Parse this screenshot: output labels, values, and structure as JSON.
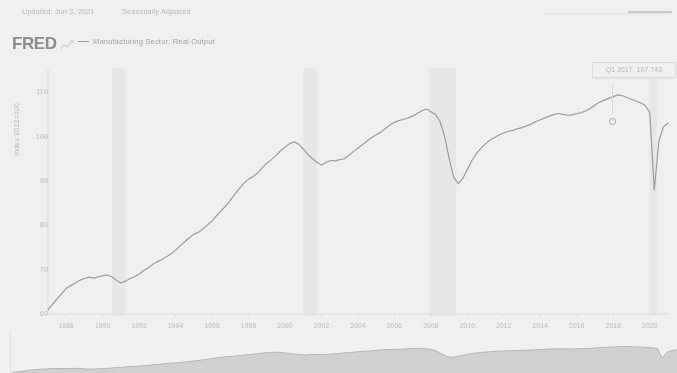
{
  "meta": {
    "updated": "Updated: Jun 3, 2021",
    "adjustment": "Seasonally Adjusted"
  },
  "header": {
    "logo": "FRED",
    "logo_mark": "mini-line-chart-icon",
    "legend_label": "Manufacturing Sector: Real Output"
  },
  "tooltip": {
    "text": "Q1 2017: 107.743"
  },
  "chart_data": {
    "type": "line",
    "title": "Manufacturing Sector: Real Output",
    "xlabel": "",
    "ylabel": "Index 2012=100",
    "ylim": [
      60,
      115
    ],
    "xlim": [
      1987.0,
      2021.0
    ],
    "grid": false,
    "legend_position": "top-left",
    "y_ticks": [
      "110",
      "100",
      "90",
      "80",
      "70",
      "60"
    ],
    "y_tick_values": [
      110,
      100,
      90,
      80,
      70,
      60
    ],
    "x_ticks": [
      "1988",
      "1990",
      "1992",
      "1994",
      "1996",
      "1998",
      "2000",
      "2002",
      "2004",
      "2006",
      "2008",
      "2010",
      "2012",
      "2014",
      "2016",
      "2018",
      "2020"
    ],
    "x_tick_values": [
      1988,
      1990,
      1992,
      1994,
      1996,
      1998,
      2000,
      2002,
      2004,
      2006,
      2008,
      2010,
      2012,
      2014,
      2016,
      2018,
      2020
    ],
    "series": [
      {
        "name": "Manufacturing Sector: Real Output",
        "color": "#8f9398",
        "x": [
          1987.0,
          1987.25,
          1987.5,
          1987.75,
          1988.0,
          1988.25,
          1988.5,
          1988.75,
          1989.0,
          1989.25,
          1989.5,
          1989.75,
          1990.0,
          1990.25,
          1990.5,
          1990.75,
          1991.0,
          1991.25,
          1991.5,
          1991.75,
          1992.0,
          1992.25,
          1992.5,
          1992.75,
          1993.0,
          1993.25,
          1993.5,
          1993.75,
          1994.0,
          1994.25,
          1994.5,
          1994.75,
          1995.0,
          1995.25,
          1995.5,
          1995.75,
          1996.0,
          1996.25,
          1996.5,
          1996.75,
          1997.0,
          1997.25,
          1997.5,
          1997.75,
          1998.0,
          1998.25,
          1998.5,
          1998.75,
          1999.0,
          1999.25,
          1999.5,
          1999.75,
          2000.0,
          2000.25,
          2000.5,
          2000.75,
          2001.0,
          2001.25,
          2001.5,
          2001.75,
          2002.0,
          2002.25,
          2002.5,
          2002.75,
          2003.0,
          2003.25,
          2003.5,
          2003.75,
          2004.0,
          2004.25,
          2004.5,
          2004.75,
          2005.0,
          2005.25,
          2005.5,
          2005.75,
          2006.0,
          2006.25,
          2006.5,
          2006.75,
          2007.0,
          2007.25,
          2007.5,
          2007.75,
          2008.0,
          2008.25,
          2008.5,
          2008.75,
          2009.0,
          2009.25,
          2009.5,
          2009.75,
          2010.0,
          2010.25,
          2010.5,
          2010.75,
          2011.0,
          2011.25,
          2011.5,
          2011.75,
          2012.0,
          2012.25,
          2012.5,
          2012.75,
          2013.0,
          2013.25,
          2013.5,
          2013.75,
          2014.0,
          2014.25,
          2014.5,
          2014.75,
          2015.0,
          2015.25,
          2015.5,
          2015.75,
          2016.0,
          2016.25,
          2016.5,
          2016.75,
          2017.0,
          2017.25,
          2017.5,
          2017.75,
          2018.0,
          2018.25,
          2018.5,
          2018.75,
          2019.0,
          2019.25,
          2019.5,
          2019.75,
          2020.0,
          2020.25,
          2020.5,
          2020.75,
          2021.0
        ],
        "y": [
          61.0,
          62.2,
          63.4,
          64.6,
          65.8,
          66.4,
          67.0,
          67.6,
          68.0,
          68.3,
          68.1,
          68.4,
          68.6,
          68.8,
          68.4,
          67.6,
          67.0,
          67.4,
          68.0,
          68.4,
          69.0,
          69.8,
          70.4,
          71.2,
          71.8,
          72.3,
          72.9,
          73.6,
          74.4,
          75.4,
          76.3,
          77.2,
          78.0,
          78.4,
          79.2,
          80.1,
          81.0,
          82.2,
          83.3,
          84.4,
          85.6,
          87.0,
          88.3,
          89.5,
          90.4,
          91.0,
          91.8,
          93.0,
          94.0,
          94.8,
          95.7,
          96.8,
          97.6,
          98.4,
          98.8,
          98.3,
          97.2,
          96.0,
          95.0,
          94.2,
          93.6,
          94.2,
          94.6,
          94.5,
          94.8,
          95.0,
          95.8,
          96.6,
          97.4,
          98.2,
          99.0,
          99.8,
          100.4,
          101.0,
          101.8,
          102.6,
          103.2,
          103.6,
          103.9,
          104.2,
          104.6,
          105.2,
          105.8,
          106.2,
          105.6,
          105.0,
          103.4,
          100.0,
          95.0,
          90.8,
          89.4,
          90.6,
          92.6,
          94.6,
          96.2,
          97.4,
          98.4,
          99.2,
          99.8,
          100.4,
          100.8,
          101.2,
          101.4,
          101.8,
          102.0,
          102.4,
          102.8,
          103.4,
          103.8,
          104.2,
          104.6,
          105.0,
          105.2,
          105.0,
          104.8,
          104.9,
          105.2,
          105.4,
          105.8,
          106.4,
          107.1,
          107.743,
          108.2,
          108.6,
          109.0,
          109.4,
          109.2,
          108.8,
          108.4,
          108.0,
          107.6,
          107.0,
          105.4,
          88.0,
          99.0,
          102.2,
          103.0
        ]
      }
    ],
    "recession_bands": [
      {
        "start": 1990.5,
        "end": 1991.25
      },
      {
        "start": 2001.0,
        "end": 2001.75
      },
      {
        "start": 2007.9,
        "end": 2009.4
      },
      {
        "start": 2020.0,
        "end": 2020.4
      }
    ]
  },
  "navigator": {
    "type": "area",
    "label": "range-selector"
  }
}
